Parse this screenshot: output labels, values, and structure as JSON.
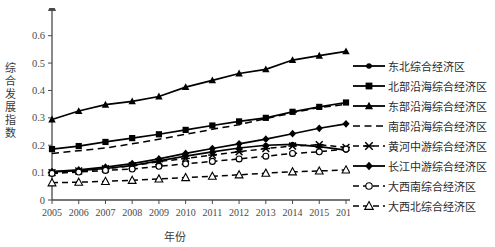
{
  "chart_data": {
    "type": "line",
    "title": "",
    "xlabel": "年份",
    "ylabel": "综合发展指数",
    "x": [
      2005,
      2006,
      2007,
      2008,
      2009,
      2010,
      2011,
      2012,
      2013,
      2014,
      2015,
      2016
    ],
    "xtick_labels": [
      "2005",
      "2006",
      "2007",
      "2008",
      "2009",
      "2010",
      "2011",
      "2012",
      "2013",
      "2014",
      "2015",
      "2016"
    ],
    "ytick_labels": [
      "0",
      "0.1",
      "0.2",
      "0.3",
      "0.4",
      "0.5",
      "0.6"
    ],
    "ytick_values": [
      0,
      0.1,
      0.2,
      0.3,
      0.4,
      0.5,
      0.6
    ],
    "ylim": [
      0,
      0.65
    ],
    "xlim": [
      2005,
      2016
    ],
    "grid": false,
    "legend_position": "right",
    "axis_color": "#4a4a4a",
    "line_color": "#000000",
    "series": [
      {
        "name": "东北综合经济区",
        "marker": "dot",
        "dash": "solid",
        "values": [
          0.103,
          0.107,
          0.115,
          0.126,
          0.143,
          0.16,
          0.176,
          0.19,
          0.2,
          0.203,
          0.195,
          0.182
        ]
      },
      {
        "name": "北部沿海综合经济区",
        "marker": "square",
        "dash": "solid",
        "values": [
          0.186,
          0.197,
          0.212,
          0.226,
          0.24,
          0.256,
          0.272,
          0.287,
          0.3,
          0.322,
          0.34,
          0.356
        ]
      },
      {
        "name": "东部沿海综合经济区",
        "marker": "triangle",
        "dash": "solid",
        "values": [
          0.294,
          0.325,
          0.348,
          0.36,
          0.378,
          0.412,
          0.437,
          0.462,
          0.477,
          0.511,
          0.527,
          0.543
        ]
      },
      {
        "name": "南部沿海综合经济区",
        "marker": "none",
        "dash": "dashed",
        "values": [
          0.17,
          0.18,
          0.19,
          0.205,
          0.222,
          0.24,
          0.258,
          0.275,
          0.297,
          0.318,
          0.338,
          0.349
        ]
      },
      {
        "name": "黄河中游综合经济区",
        "marker": "x",
        "dash": "dashed",
        "values": [
          0.1,
          0.106,
          0.114,
          0.125,
          0.14,
          0.152,
          0.164,
          0.176,
          0.188,
          0.197,
          0.202,
          0.192
        ]
      },
      {
        "name": "长江中游综合经济区",
        "marker": "diamond",
        "dash": "solid",
        "values": [
          0.104,
          0.11,
          0.12,
          0.133,
          0.15,
          0.17,
          0.188,
          0.205,
          0.222,
          0.242,
          0.262,
          0.278
        ]
      },
      {
        "name": "大西南综合经济区",
        "marker": "circle",
        "dash": "dashed",
        "values": [
          0.097,
          0.102,
          0.108,
          0.113,
          0.123,
          0.132,
          0.141,
          0.15,
          0.16,
          0.17,
          0.176,
          0.186
        ]
      },
      {
        "name": "大西北综合经济区",
        "marker": "opentriangle",
        "dash": "dashed",
        "values": [
          0.063,
          0.065,
          0.068,
          0.072,
          0.077,
          0.082,
          0.087,
          0.092,
          0.098,
          0.103,
          0.106,
          0.11
        ]
      }
    ]
  },
  "ylabel_chars": [
    "综",
    "合",
    "发",
    "展",
    "指",
    "数"
  ]
}
